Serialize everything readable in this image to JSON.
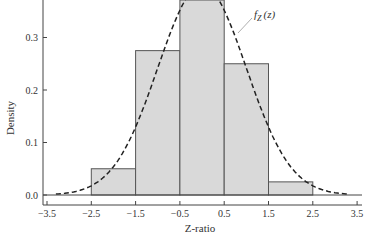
{
  "chart_data": {
    "type": "bar",
    "title": "",
    "xlabel": "Z-ratio",
    "ylabel": "Density",
    "xlim": [
      -3.5,
      3.5
    ],
    "ylim": [
      0.0,
      0.35
    ],
    "x_ticks": [
      "-3.5",
      "-2.5",
      "-1.5",
      "-0.5",
      "0.5",
      "1.5",
      "2.5",
      "3.5"
    ],
    "y_ticks": [
      "0.0",
      "0.1",
      "0.2",
      "0.3"
    ],
    "bins": [
      {
        "from": -2.5,
        "to": -1.5,
        "density": 0.05
      },
      {
        "from": -1.5,
        "to": -0.5,
        "density": 0.275
      },
      {
        "from": -0.5,
        "to": 0.5,
        "density": 0.4
      },
      {
        "from": 0.5,
        "to": 1.5,
        "density": 0.25
      },
      {
        "from": 1.5,
        "to": 2.5,
        "density": 0.025
      }
    ],
    "categories": [
      "[-2.5,-1.5)",
      "[-1.5,-0.5)",
      "[-0.5,0.5)",
      "[0.5,1.5)",
      "[1.5,2.5)"
    ],
    "values": [
      0.05,
      0.275,
      0.4,
      0.25,
      0.025
    ],
    "overlay": {
      "type": "line",
      "style": "dashed",
      "label": "f_Z(z)",
      "function": "standard normal density",
      "x_range": [
        -3.3,
        3.3
      ]
    },
    "grid": false,
    "legend": "none",
    "annotations": [
      {
        "text": "f_Z(z)",
        "points_to": "dashed curve near z=0.7"
      }
    ]
  },
  "colors": {
    "bar_fill": "#d9d9d9",
    "bar_edge": "#555555",
    "curve": "#222222",
    "axis": "#444444"
  },
  "labels": {
    "xlabel": "Z-ratio",
    "ylabel": "Density",
    "curve_f": "f",
    "curve_sub": "Z",
    "curve_arg": "(z)"
  }
}
